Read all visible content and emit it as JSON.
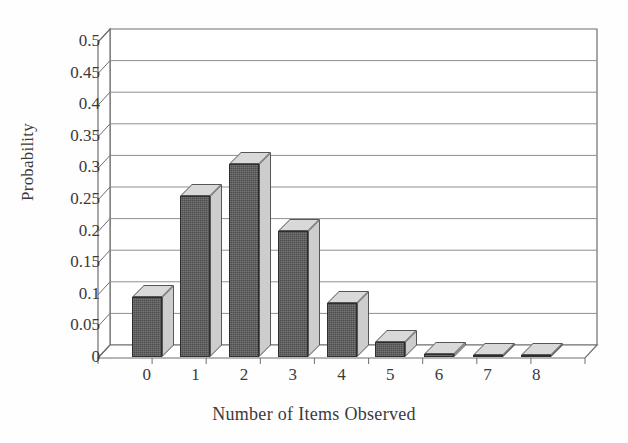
{
  "chart_data": {
    "type": "bar",
    "title": "",
    "subtitle": "",
    "xlabel": "Number of Items Observed",
    "ylabel": "Probability",
    "categories": [
      "0",
      "1",
      "2",
      "3",
      "4",
      "5",
      "6",
      "7",
      "8"
    ],
    "values": [
      0.095,
      0.255,
      0.305,
      0.2,
      0.085,
      0.023,
      0.005,
      0.001,
      0.001
    ],
    "series": [
      {
        "name": "Probability",
        "values": [
          0.095,
          0.255,
          0.305,
          0.2,
          0.085,
          0.023,
          0.005,
          0.001,
          0.001
        ]
      }
    ],
    "ylim": [
      0,
      0.5
    ],
    "ytick_labels": [
      "0",
      "0.05",
      "0.1",
      "0.15",
      "0.2",
      "0.25",
      "0.3",
      "0.35",
      "0.4",
      "0.45",
      "0.5"
    ],
    "ytick_values": [
      0,
      0.05,
      0.1,
      0.15,
      0.2,
      0.25,
      0.3,
      0.35,
      0.4,
      0.45,
      0.5
    ],
    "xtick_labels": [
      "0",
      "1",
      "2",
      "3",
      "4",
      "5",
      "6",
      "7",
      "8"
    ],
    "grid": true,
    "grid_axis": "y",
    "legend": false,
    "legend_position": "none",
    "style": "3d-column",
    "colors": {
      "bar_front": "#4d4d4d",
      "bar_top": "#d9d9d9",
      "bar_side": "#cdcdcd",
      "grid_line": "#8a8a8a",
      "axis_line": "#555555",
      "background": "#fefefe",
      "text": "#3a3a3a"
    }
  }
}
